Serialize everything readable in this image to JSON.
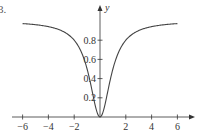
{
  "problem_number": "3.",
  "chart_data": {
    "type": "line",
    "title": "",
    "xlabel": "",
    "ylabel": "y",
    "function": "y = x^2 / (1 + x^2)",
    "xlim": [
      -6,
      6
    ],
    "ylim": [
      0,
      1
    ],
    "x_ticks": [
      -6,
      -4,
      -2,
      2,
      4,
      6
    ],
    "x_tick_labels": [
      "−6",
      "−4",
      "−2",
      "2",
      "4",
      "6"
    ],
    "y_ticks": [
      0.2,
      0.4,
      0.6,
      0.8
    ],
    "y_tick_labels": [
      "0.2",
      "0.4",
      "0.6",
      "0.8"
    ],
    "grid": false,
    "legend": null,
    "series": [
      {
        "name": "curve",
        "x": [
          -6,
          -5,
          -4,
          -3,
          -2,
          -1.5,
          -1,
          -0.5,
          0,
          0.5,
          1,
          1.5,
          2,
          3,
          4,
          5,
          6
        ],
        "values": [
          0.973,
          0.962,
          0.941,
          0.9,
          0.8,
          0.692,
          0.5,
          0.2,
          0,
          0.2,
          0.5,
          0.692,
          0.8,
          0.9,
          0.941,
          0.962,
          0.973
        ]
      }
    ],
    "colors": {
      "axis": "#333333",
      "curve": "#444444"
    }
  }
}
